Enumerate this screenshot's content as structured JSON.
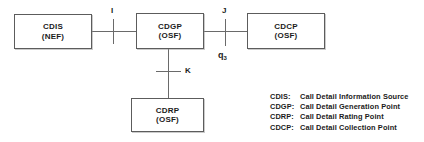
{
  "diagram": {
    "type": "network-architecture-block-diagram",
    "nodes": [
      {
        "id": "cdis",
        "name": "CDIS",
        "type": "(NEF)"
      },
      {
        "id": "cdgp",
        "name": "CDGP",
        "type": "(OSF)"
      },
      {
        "id": "cdcp",
        "name": "CDCP",
        "type": "(OSF)"
      },
      {
        "id": "cdrp",
        "name": "CDRP",
        "type": "(OSF)"
      }
    ],
    "interfaces": [
      {
        "id": "i",
        "label": "I",
        "between": "CDIS - CDGP"
      },
      {
        "id": "j",
        "label": "J",
        "between": "CDGP - CDCP"
      },
      {
        "id": "k",
        "label": "K",
        "between": "CDGP - CDRP"
      }
    ],
    "protocol": {
      "base": "q",
      "subscript": "3"
    },
    "legend": [
      {
        "abbr": "CDIS:",
        "desc": "Call Detail Information Source"
      },
      {
        "abbr": "CDGP:",
        "desc": "Call Detail Generation Point"
      },
      {
        "abbr": "CDRP:",
        "desc": "Call Detail Rating Point"
      },
      {
        "abbr": "CDCP:",
        "desc": "Call Detail Collection Point"
      }
    ],
    "colors": {
      "background": "#ffffff",
      "line": "#6a6a6a",
      "border": "#5c5c5c",
      "text": "#1b1b1b"
    }
  }
}
